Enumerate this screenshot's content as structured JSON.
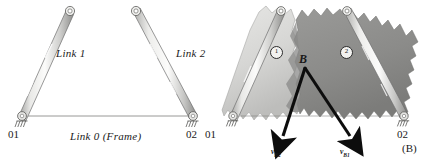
{
  "figure": {
    "panel_label": "(B)",
    "background_color": "#ffffff",
    "ink_color": "#1a1a1a"
  },
  "panel_a": {
    "name": "linkage-skeleton",
    "links": [
      {
        "id": "link1",
        "label": "Link 1"
      },
      {
        "id": "link2",
        "label": "Link 2"
      },
      {
        "id": "link0",
        "label": "Link 0 (Frame)"
      }
    ],
    "pivots": [
      {
        "id": "o1",
        "label": "01"
      },
      {
        "id": "o2",
        "label": "02"
      }
    ],
    "link_color": "#d8d8d6",
    "link_edge_color": "#6e6e6e"
  },
  "panel_b": {
    "name": "body-regions-velocity",
    "point_label": "B",
    "regions": [
      {
        "id": "region1",
        "label": "1",
        "fill": "#d9d9d7"
      },
      {
        "id": "region2",
        "label": "2",
        "fill": "#8f8f8d"
      }
    ],
    "pivots": [
      {
        "id": "o1",
        "label": "01"
      },
      {
        "id": "o2",
        "label": "02"
      }
    ],
    "vectors": [
      {
        "id": "vb2",
        "symbol": "v",
        "subscript": "B2"
      },
      {
        "id": "vb1",
        "symbol": "v",
        "subscript": "B1"
      }
    ],
    "vector_color": "#0d0d0d"
  }
}
